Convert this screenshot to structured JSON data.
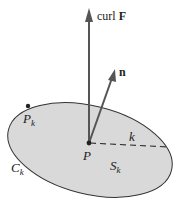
{
  "diagram": {
    "colors": {
      "surface_fill": "#d9d9d9",
      "stroke": "#333333",
      "vector": "#555555"
    },
    "vectors": {
      "curl": {
        "label_prefix": "curl ",
        "label_bold": "F"
      },
      "normal": {
        "label": "n"
      }
    },
    "points": {
      "P": {
        "label": "P"
      },
      "Pk": {
        "label": "P",
        "subscript": "k"
      }
    },
    "radius": {
      "label": "k"
    },
    "boundary": {
      "label": "C",
      "subscript": "k"
    },
    "surface": {
      "label": "S",
      "subscript": "k"
    }
  }
}
